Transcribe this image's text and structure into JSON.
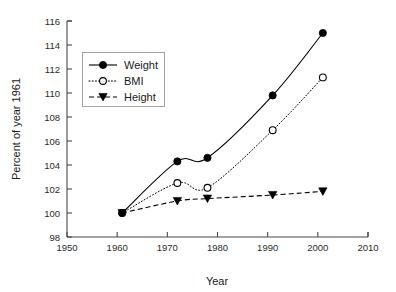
{
  "chart_data": {
    "type": "line",
    "title": "",
    "subtitle": "",
    "xlabel": "Year",
    "ylabel": "Percent of year 1961",
    "xlim": [
      1950,
      2010
    ],
    "ylim": [
      98,
      116
    ],
    "xticks": [
      1950,
      1960,
      1970,
      1980,
      1990,
      2000,
      2010
    ],
    "xtick_labels": [
      "1950",
      "1960",
      "1970",
      "1980",
      "1990",
      "2000",
      "2010"
    ],
    "yticks": [
      98,
      100,
      102,
      104,
      106,
      108,
      110,
      112,
      114,
      116
    ],
    "ytick_labels": [
      "98",
      "100",
      "102",
      "104",
      "106",
      "108",
      "110",
      "112",
      "114",
      "116"
    ],
    "grid": false,
    "legend_position": "upper-left",
    "x": [
      1961,
      1972,
      1978,
      1991,
      2001
    ],
    "series": [
      {
        "name": "Weight",
        "values": [
          100.0,
          104.3,
          104.6,
          109.8,
          115.0
        ],
        "line_style": "solid",
        "marker": "filled-circle",
        "color": "#000000"
      },
      {
        "name": "BMI",
        "values": [
          100.0,
          102.5,
          102.1,
          106.9,
          111.3
        ],
        "line_style": "dotted",
        "marker": "open-circle",
        "color": "#000000"
      },
      {
        "name": "Height",
        "values": [
          100.0,
          101.0,
          101.2,
          101.5,
          101.8
        ],
        "line_style": "dashed",
        "marker": "filled-triangle-down",
        "color": "#000000"
      }
    ]
  },
  "legend": {
    "entries": [
      {
        "label": "Weight"
      },
      {
        "label": "BMI"
      },
      {
        "label": "Height"
      }
    ]
  },
  "axes": {
    "x_title": "Year",
    "y_title": "Percent of year 1961"
  }
}
